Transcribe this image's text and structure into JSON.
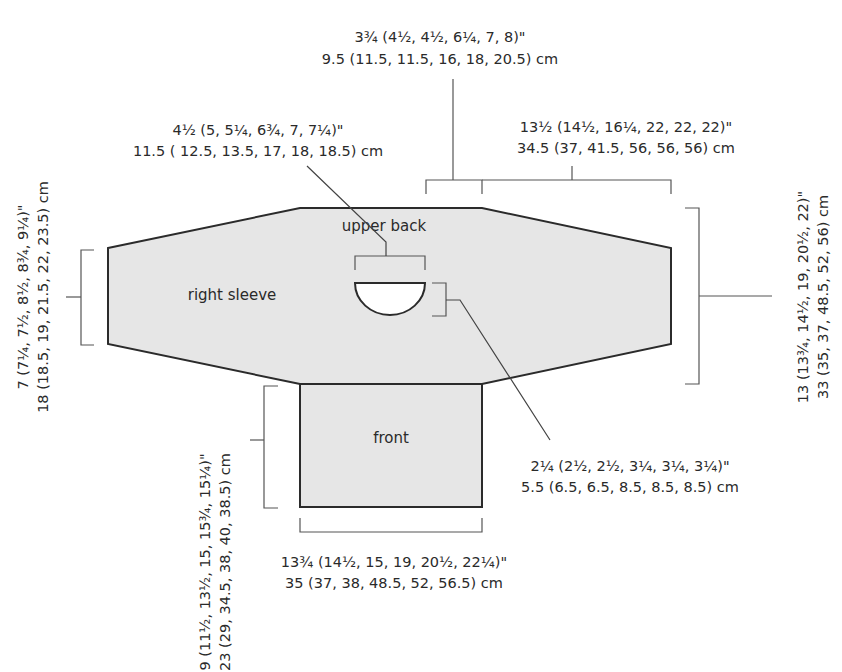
{
  "diagram": {
    "type": "knitting-schematic",
    "colors": {
      "piece_fill": "#e6e6e6",
      "outline": "#2b2b2b",
      "dimension_line": "#555555",
      "text": "#2a2a2a",
      "background": "#ffffff"
    },
    "pieces": {
      "upper_back": "upper back",
      "right_sleeve": "right sleeve",
      "front": "front"
    },
    "measurements": {
      "neck_to_center": {
        "inches": "3¾ (4½, 4½, 6¼, 7, 8)\"",
        "cm": "9.5 (11.5, 11.5, 16, 18, 20.5) cm"
      },
      "neck_width": {
        "inches": "4½ (5, 5¼, 6¾, 7, 7¼)\"",
        "cm": "11.5 ( 12.5, 13.5, 17, 18, 18.5) cm"
      },
      "upper_body_half_width": {
        "inches": "13½ (14½, 16¼, 22, 22, 22)\"",
        "cm": "34.5 (37, 41.5, 56, 56, 56) cm"
      },
      "sleeve_cuff_height": {
        "inches": "7 (7¼, 7½, 8½, 8¾, 9¼)\"",
        "cm": "18 (18.5, 19, 21.5, 22, 23.5) cm"
      },
      "body_height": {
        "inches": "13 (13¾, 14½, 19, 20½, 22)\"",
        "cm": "33 (35, 37, 48.5, 52, 56) cm"
      },
      "neck_depth": {
        "inches": "2¼ (2½, 2½, 3¼, 3¼, 3¼)\"",
        "cm": "5.5 (6.5, 6.5, 8.5, 8.5, 8.5) cm"
      },
      "front_height": {
        "inches": "9 (11½, 13½, 15, 15¾, 15¼)\"",
        "cm": "23 (29, 34.5, 38, 40, 38.5) cm"
      },
      "front_width": {
        "inches": "13¾ (14½, 15, 19, 20½, 22¼)\"",
        "cm": "35 (37, 38, 48.5, 52, 56.5) cm"
      }
    }
  }
}
